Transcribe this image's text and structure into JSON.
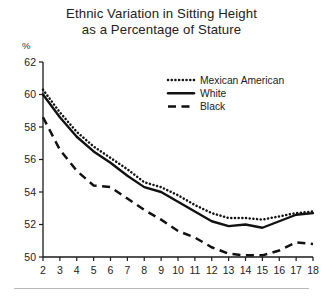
{
  "chart_data": {
    "type": "line",
    "title": "Ethnic Variation in Sitting Height as a Percentage of Stature",
    "title_line1": "Ethnic Variation in Sitting Height",
    "title_line2": "as a Percentage of Stature",
    "xlabel": "",
    "ylabel": "%",
    "ylim": [
      50,
      62
    ],
    "xlim": [
      2,
      18
    ],
    "yticks": [
      50,
      52,
      54,
      56,
      58,
      60,
      62
    ],
    "grid": false,
    "legend_position": "top-right",
    "x": [
      2,
      3,
      4,
      5,
      6,
      7,
      8,
      9,
      10,
      11,
      12,
      13,
      14,
      15,
      16,
      17,
      18
    ],
    "categories": [
      "2",
      "3",
      "4",
      "5",
      "6",
      "7",
      "8",
      "9",
      "10",
      "11",
      "12",
      "13",
      "14",
      "15",
      "16",
      "17",
      "18"
    ],
    "series": [
      {
        "name": "Mexican American",
        "style": "dotted",
        "values": [
          60.3,
          58.9,
          57.7,
          56.8,
          56.1,
          55.4,
          54.6,
          54.3,
          53.8,
          53.2,
          52.7,
          52.4,
          52.4,
          52.3,
          52.5,
          52.7,
          52.8
        ]
      },
      {
        "name": "White",
        "style": "solid",
        "values": [
          60.0,
          58.6,
          57.4,
          56.5,
          55.8,
          55.0,
          54.3,
          54.0,
          53.4,
          52.8,
          52.2,
          51.9,
          52.0,
          51.8,
          52.2,
          52.6,
          52.7
        ]
      },
      {
        "name": "Black",
        "style": "dashed",
        "values": [
          58.6,
          56.6,
          55.3,
          54.4,
          54.3,
          53.6,
          52.9,
          52.3,
          51.6,
          51.2,
          50.6,
          50.2,
          50.1,
          50.1,
          50.4,
          50.9,
          50.8
        ]
      }
    ]
  },
  "legend": {
    "items": [
      {
        "label": "Mexican American",
        "style": "dotted"
      },
      {
        "label": "White",
        "style": "solid"
      },
      {
        "label": "Black",
        "style": "dashed"
      }
    ]
  }
}
